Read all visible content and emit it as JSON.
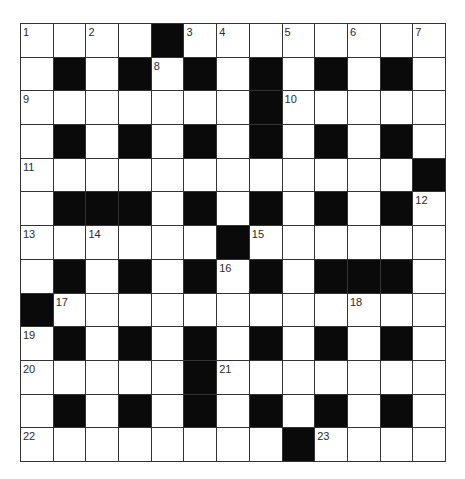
{
  "puzzle": {
    "rows": 13,
    "cols": 13,
    "colors": {
      "white_cell": "#ffffff",
      "black_cell": "#0a0a0a",
      "grid_line": "#333333",
      "number_text": "#2a2a2a"
    },
    "layout": [
      "....#........",
      ".#.#.#.#.#.#.",
      ".......#.....",
      ".#.#.#.#.#.#.",
      "............#",
      ".###.#.#.#.#.",
      "......#......",
      ".#.#.#.#.###.",
      "#............",
      ".#.#.#.#.#.#.",
      ".....#.......",
      ".#.#.#.#.#.#.",
      "........#...."
    ],
    "numbers": [
      {
        "row": 0,
        "col": 0,
        "n": "1"
      },
      {
        "row": 0,
        "col": 2,
        "n": "2"
      },
      {
        "row": 0,
        "col": 5,
        "n": "3"
      },
      {
        "row": 0,
        "col": 6,
        "n": "4"
      },
      {
        "row": 0,
        "col": 8,
        "n": "5"
      },
      {
        "row": 0,
        "col": 10,
        "n": "6"
      },
      {
        "row": 0,
        "col": 12,
        "n": "7"
      },
      {
        "row": 1,
        "col": 4,
        "n": "8"
      },
      {
        "row": 2,
        "col": 0,
        "n": "9"
      },
      {
        "row": 2,
        "col": 8,
        "n": "10"
      },
      {
        "row": 4,
        "col": 0,
        "n": "11"
      },
      {
        "row": 5,
        "col": 12,
        "n": "12"
      },
      {
        "row": 6,
        "col": 0,
        "n": "13"
      },
      {
        "row": 6,
        "col": 2,
        "n": "14"
      },
      {
        "row": 6,
        "col": 7,
        "n": "15"
      },
      {
        "row": 7,
        "col": 6,
        "n": "16"
      },
      {
        "row": 8,
        "col": 1,
        "n": "17"
      },
      {
        "row": 8,
        "col": 10,
        "n": "18"
      },
      {
        "row": 9,
        "col": 0,
        "n": "19"
      },
      {
        "row": 10,
        "col": 0,
        "n": "20"
      },
      {
        "row": 10,
        "col": 6,
        "n": "21"
      },
      {
        "row": 12,
        "col": 0,
        "n": "22"
      },
      {
        "row": 12,
        "col": 9,
        "n": "23"
      }
    ]
  }
}
